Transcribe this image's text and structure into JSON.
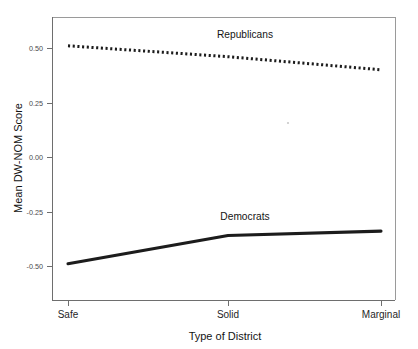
{
  "chart_data": {
    "type": "line",
    "title": "",
    "xlabel": "Type of District",
    "ylabel": "Mean DW-NOM Score",
    "categories": [
      "Safe",
      "Solid",
      "Marginal"
    ],
    "series": [
      {
        "name": "Republicans",
        "values": [
          0.51,
          0.46,
          0.4
        ],
        "style": "dotted",
        "color": "#1c1c1c"
      },
      {
        "name": "Democrats",
        "values": [
          -0.49,
          -0.36,
          -0.34
        ],
        "style": "solid",
        "color": "#1c1c1c"
      }
    ],
    "ylim": [
      -0.62,
      0.62
    ],
    "yticks": [
      0.5,
      0.25,
      0.0,
      -0.25,
      -0.5
    ],
    "ytick_labels": [
      "0.50",
      "0.25",
      "0.00",
      "-0.25",
      "-0.50"
    ],
    "grid": false,
    "legend_position": "inline-annotations",
    "annotations": [
      {
        "text": "Republicans",
        "x_category": "Solid",
        "y": 0.58
      },
      {
        "text": "Democrats",
        "x_category": "Solid",
        "y": -0.285
      }
    ]
  },
  "axes": {
    "y_title": "Mean DW-NOM Score",
    "x_title": "Type of District",
    "y_tick_0": "0.50",
    "y_tick_1": "0.25",
    "y_tick_2": "0.00",
    "y_tick_3": "-0.25",
    "y_tick_4": "-0.50",
    "x_cat_0": "Safe",
    "x_cat_1": "Solid",
    "x_cat_2": "Marginal"
  },
  "labels": {
    "republicans": "Republicans",
    "democrats": "Democrats"
  }
}
